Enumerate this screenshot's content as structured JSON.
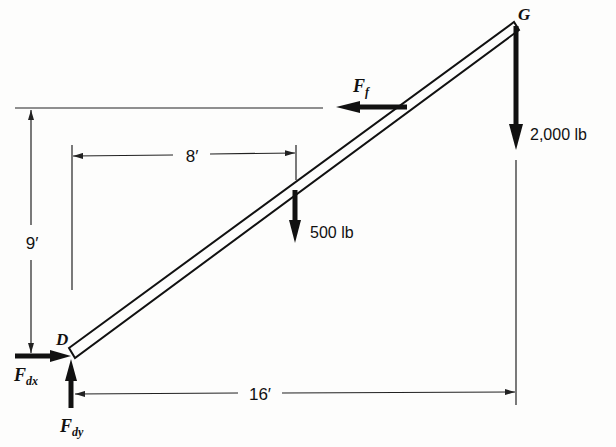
{
  "diagram": {
    "type": "free-body diagram of inclined beam",
    "points": {
      "bottom": {
        "label": "D"
      },
      "top": {
        "label": "G"
      }
    },
    "forces": {
      "load_top": {
        "label": "2,000 lb",
        "direction": "down"
      },
      "load_mid": {
        "label": "500 lb",
        "direction": "down"
      },
      "friction": {
        "label_main": "F",
        "label_sub": "f",
        "direction": "left"
      },
      "reaction_x": {
        "label_main": "F",
        "label_sub": "dx",
        "direction": "right"
      },
      "reaction_y": {
        "label_main": "F",
        "label_sub": "dy",
        "direction": "up"
      }
    },
    "dimensions": {
      "height": {
        "label": "9′"
      },
      "half_span": {
        "label": "8′"
      },
      "span": {
        "label": "16′"
      }
    }
  }
}
